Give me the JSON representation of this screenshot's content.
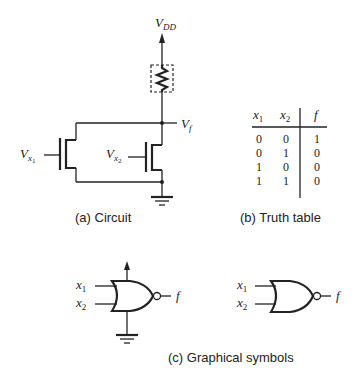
{
  "circuit": {
    "supply_label": "V",
    "supply_sub": "DD",
    "output_label": "V",
    "output_sub": "f",
    "input1_label": "V",
    "input1_sub": "x",
    "input1_subsub": "1",
    "input2_label": "V",
    "input2_sub": "x",
    "input2_subsub": "2",
    "caption": "(a) Circuit"
  },
  "truth_table": {
    "headers": [
      "x1",
      "x2",
      "f"
    ],
    "header_display": [
      {
        "v": "x",
        "s": "1"
      },
      {
        "v": "x",
        "s": "2"
      },
      {
        "v": "f",
        "s": ""
      }
    ],
    "rows": [
      [
        "0",
        "0",
        "1"
      ],
      [
        "0",
        "1",
        "0"
      ],
      [
        "1",
        "0",
        "0"
      ],
      [
        "1",
        "1",
        "0"
      ]
    ],
    "caption": "(b) Truth table"
  },
  "symbols": {
    "gate_type": "NOR",
    "input1": "x",
    "input1_sub": "1",
    "input2": "x",
    "input2_sub": "2",
    "output": "f",
    "caption": "(c) Graphical symbols"
  }
}
